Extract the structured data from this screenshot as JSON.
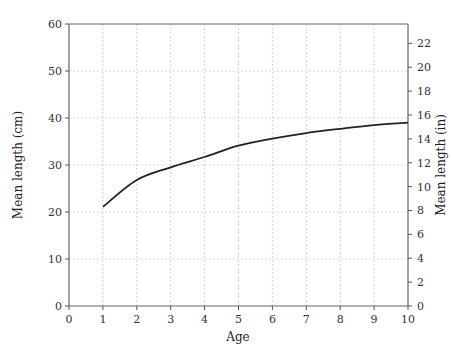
{
  "chart_data": {
    "type": "line",
    "title": "",
    "xlabel": "Age",
    "ylabel": "Mean length (cm)",
    "ylabel_right": "Mean length (in)",
    "xlim": [
      0,
      10
    ],
    "ylim": [
      0,
      60
    ],
    "ylim_right": [
      0,
      23.62
    ],
    "x_ticks": [
      0,
      1,
      2,
      3,
      4,
      5,
      6,
      7,
      8,
      9,
      10
    ],
    "y_ticks": [
      0,
      10,
      20,
      30,
      40,
      50,
      60
    ],
    "y_right_ticks": [
      0,
      2,
      4,
      6,
      8,
      10,
      12,
      14,
      16,
      18,
      20,
      22
    ],
    "grid": true,
    "grid_style": "dotted",
    "legend": null,
    "series": [
      {
        "name": "Mean length",
        "x": [
          1,
          2,
          3,
          4,
          5,
          6,
          7,
          8,
          9,
          10
        ],
        "values": [
          21.1,
          26.8,
          29.5,
          31.7,
          34.1,
          35.6,
          36.8,
          37.7,
          38.5,
          39.0
        ],
        "color": "#222222"
      }
    ]
  }
}
